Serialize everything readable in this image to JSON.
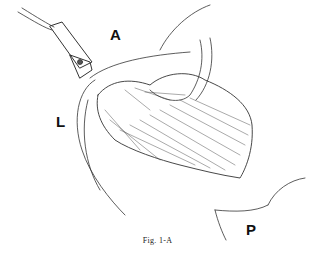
{
  "figure": {
    "labels": {
      "anterior": "A",
      "lateral": "L",
      "posterior": "P"
    },
    "caption": "Fig. 1-A",
    "line_color": "#333333"
  }
}
